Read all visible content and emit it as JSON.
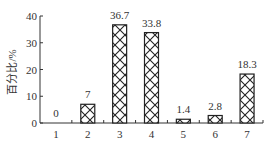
{
  "chart_data": {
    "type": "bar",
    "title": "",
    "xlabel": "",
    "ylabel": "百分比/%",
    "categories": [
      "1",
      "2",
      "3",
      "4",
      "5",
      "6",
      "7"
    ],
    "values": [
      0,
      7,
      36.7,
      33.8,
      1.4,
      2.8,
      18.3
    ],
    "data_labels": [
      "0",
      "7",
      "36.7",
      "33.8",
      "1.4",
      "2.8",
      "18.3"
    ],
    "yticks": [
      0,
      10,
      20,
      30,
      40
    ],
    "ylim": [
      0,
      40
    ],
    "grid": false,
    "legend": null,
    "bar_fill": "crosshatch",
    "colors": {
      "bar_stroke": "#222222",
      "axis": "#333333",
      "text": "#333333"
    }
  }
}
